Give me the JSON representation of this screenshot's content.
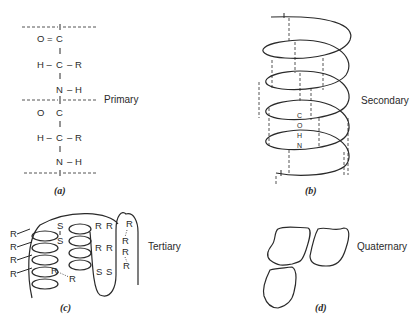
{
  "panels": {
    "a": {
      "caption": "(a)",
      "label": "Primary",
      "rows": [
        {
          "left": "O =",
          "center": "C",
          "right": ""
        },
        {
          "left": "H –",
          "center": "C",
          "right": "– R"
        },
        {
          "left": "",
          "center": "N",
          "right": "– H"
        },
        {
          "left": "O",
          "center": "C",
          "right": ""
        },
        {
          "left": "H –",
          "center": "C",
          "right": "– R"
        },
        {
          "left": "",
          "center": "N",
          "right": "– H"
        }
      ]
    },
    "b": {
      "caption": "(b)",
      "label": "Secondary",
      "hbond_atoms": [
        "C",
        "O",
        "H",
        "N"
      ]
    },
    "c": {
      "caption": "(c)",
      "label": "Tertiary",
      "side_groups": [
        "R",
        "R",
        "R",
        "R",
        "R",
        "R",
        "R",
        "R",
        "R",
        "R",
        "R",
        "R",
        "R",
        "R"
      ],
      "disulfide": [
        "S",
        "S",
        "S",
        "S"
      ]
    },
    "d": {
      "caption": "(d)",
      "label": "Quaternary"
    }
  }
}
